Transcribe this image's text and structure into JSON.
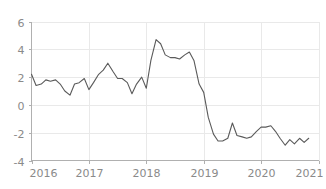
{
  "chart_data": {
    "type": "line",
    "title": "",
    "subtitle": "",
    "xlabel": "",
    "ylabel": "",
    "xlim": [
      2016.0,
      2021.0
    ],
    "ylim": [
      -4,
      6
    ],
    "grid": true,
    "legend": "none",
    "x_ticks": [
      "2016",
      "2017",
      "2018",
      "2019",
      "2020",
      "2021"
    ],
    "x_tick_values": [
      2016,
      2017,
      2018,
      2019,
      2020,
      2021
    ],
    "y_ticks": [
      "6",
      "4",
      "2",
      "0",
      "-2",
      "-4"
    ],
    "y_tick_values": [
      6,
      4,
      2,
      0,
      -2,
      -4
    ],
    "series": [
      {
        "name": "series-1",
        "color": "#5a5a5a",
        "x": [
          2016.0,
          2016.08,
          2016.17,
          2016.25,
          2016.33,
          2016.42,
          2016.5,
          2016.58,
          2016.67,
          2016.75,
          2016.83,
          2016.92,
          2017.0,
          2017.08,
          2017.17,
          2017.25,
          2017.33,
          2017.42,
          2017.5,
          2017.58,
          2017.67,
          2017.75,
          2017.83,
          2017.92,
          2018.0,
          2018.08,
          2018.17,
          2018.25,
          2018.33,
          2018.42,
          2018.5,
          2018.58,
          2018.67,
          2018.75,
          2018.83,
          2018.92,
          2019.0,
          2019.08,
          2019.17,
          2019.25,
          2019.33,
          2019.42,
          2019.5,
          2019.58,
          2019.67,
          2019.75,
          2019.83,
          2019.92,
          2020.0,
          2020.08,
          2020.17,
          2020.25,
          2020.33,
          2020.42,
          2020.5,
          2020.58,
          2020.67,
          2020.75,
          2020.83
        ],
        "y": [
          2.2,
          1.4,
          1.5,
          1.8,
          1.7,
          1.8,
          1.5,
          1.0,
          0.7,
          1.5,
          1.6,
          1.9,
          1.1,
          1.6,
          2.2,
          2.5,
          3.0,
          2.4,
          1.9,
          1.9,
          1.6,
          0.8,
          1.5,
          2.0,
          1.2,
          3.2,
          4.7,
          4.4,
          3.6,
          3.4,
          3.4,
          3.3,
          3.6,
          3.8,
          3.2,
          1.5,
          0.9,
          -0.9,
          -2.1,
          -2.6,
          -2.6,
          -2.4,
          -1.3,
          -2.2,
          -2.3,
          -2.4,
          -2.3,
          -1.9,
          -1.6,
          -1.6,
          -1.5,
          -1.9,
          -2.4,
          -2.9,
          -2.5,
          -2.8,
          -2.4,
          -2.7,
          -2.4
        ]
      }
    ]
  },
  "axes": {
    "y_axis_name": "value-axis",
    "x_axis_name": "time-axis"
  }
}
